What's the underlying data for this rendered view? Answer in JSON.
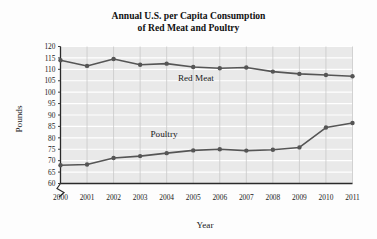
{
  "chart_data": {
    "type": "line",
    "title": "Annual U.S. per Capita Consumption of Red Meat and Poultry",
    "title_line1": "Annual U.S. per Capita Consumption",
    "title_line2": "of Red Meat and Poultry",
    "xlabel": "Year",
    "ylabel": "Pounds",
    "x": [
      2000,
      2001,
      2002,
      2003,
      2004,
      2005,
      2006,
      2007,
      2008,
      2009,
      2010,
      2011
    ],
    "xtick_labels": [
      "2000",
      "2001",
      "2002",
      "2003",
      "2004",
      "2005",
      "2006",
      "2007",
      "2008",
      "2009",
      "2010",
      "2011"
    ],
    "ytick_labels": [
      "60",
      "65",
      "70",
      "75",
      "80",
      "85",
      "90",
      "95",
      "100",
      "105",
      "110",
      "115",
      "120"
    ],
    "yticks": [
      60,
      65,
      70,
      75,
      80,
      85,
      90,
      95,
      100,
      105,
      110,
      115,
      120
    ],
    "xlim": [
      2000,
      2011
    ],
    "ylim": [
      60,
      120
    ],
    "grid": true,
    "legend_position": "inline-annotation",
    "axis_break": true,
    "series": [
      {
        "name": "Red Meat",
        "label": "Red Meat",
        "color": "#555555",
        "values": [
          114.0,
          111.5,
          114.5,
          112.0,
          112.5,
          111.0,
          110.5,
          110.8,
          109.0,
          108.0,
          107.5,
          107.0
        ],
        "label_x": 2005.1,
        "label_y": 105.0
      },
      {
        "name": "Poultry",
        "label": "Poultry",
        "color": "#555555",
        "values": [
          68.0,
          68.3,
          71.2,
          72.0,
          73.3,
          74.5,
          75.0,
          74.4,
          74.8,
          75.8,
          84.5,
          86.5
        ],
        "label_x": 2003.9,
        "label_y": 80.2
      }
    ]
  }
}
